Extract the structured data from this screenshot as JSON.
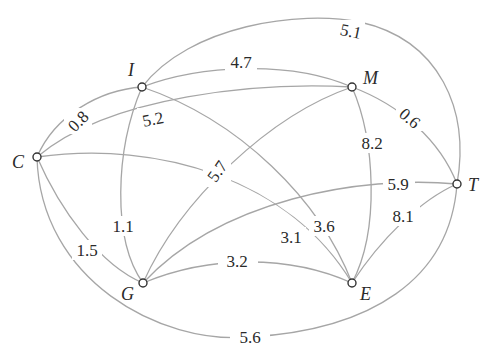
{
  "diagram": {
    "type": "weighted-undirected-graph",
    "nodes": [
      {
        "id": "I",
        "label": "I"
      },
      {
        "id": "M",
        "label": "M"
      },
      {
        "id": "C",
        "label": "C"
      },
      {
        "id": "T",
        "label": "T"
      },
      {
        "id": "G",
        "label": "G"
      },
      {
        "id": "E",
        "label": "E"
      }
    ],
    "edges": [
      {
        "from": "C",
        "to": "I",
        "weight": "0.8"
      },
      {
        "from": "I",
        "to": "M",
        "weight": "4.7"
      },
      {
        "from": "I",
        "to": "T",
        "weight": "5.1"
      },
      {
        "from": "M",
        "to": "T",
        "weight": "0.6"
      },
      {
        "from": "C",
        "to": "M",
        "weight": "5.2"
      },
      {
        "from": "I",
        "to": "G",
        "weight": "1.1"
      },
      {
        "from": "I",
        "to": "E",
        "weight": "3.6"
      },
      {
        "from": "G",
        "to": "M",
        "weight": "5.7"
      },
      {
        "from": "M",
        "to": "E",
        "weight": "8.2"
      },
      {
        "from": "C",
        "to": "E",
        "weight": "3.1"
      },
      {
        "from": "G",
        "to": "T",
        "weight": "5.9"
      },
      {
        "from": "C",
        "to": "G",
        "weight": "1.5"
      },
      {
        "from": "G",
        "to": "E",
        "weight": "3.2"
      },
      {
        "from": "E",
        "to": "T",
        "weight": "8.1"
      },
      {
        "from": "C",
        "to": "T",
        "weight": "5.6"
      }
    ]
  }
}
